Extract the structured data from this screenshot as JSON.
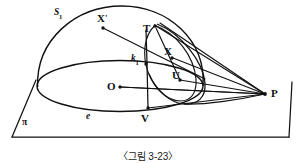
{
  "figure": {
    "caption": "〈그림 3-23〉",
    "type": "geometry-diagram",
    "stroke_color": "#111111",
    "background_color": "#ffffff"
  },
  "labels": {
    "sphere": {
      "text": "S",
      "subscript": "1",
      "x": 54,
      "y": 8
    },
    "x_prime": {
      "text": "X",
      "prime": "'",
      "x": 97,
      "y": 13
    },
    "tangent_point_t": {
      "text": "T",
      "x": 143,
      "y": 23
    },
    "point_x": {
      "text": "X",
      "x": 164,
      "y": 46
    },
    "circle_k": {
      "text": "k",
      "subscript": "1",
      "x": 131,
      "y": 54
    },
    "point_u": {
      "text": "U",
      "x": 172,
      "y": 70
    },
    "center_o": {
      "text": "O",
      "x": 107,
      "y": 81
    },
    "ellipse_e": {
      "text": "e",
      "x": 86,
      "y": 112
    },
    "point_v": {
      "text": "V",
      "x": 141,
      "y": 113
    },
    "apex_p": {
      "text": "P",
      "x": 271,
      "y": 88
    },
    "plane_pi": {
      "text": "π",
      "x": 22,
      "y": 118
    }
  },
  "points": {
    "x_prime_dot": {
      "x": 103,
      "y": 27
    },
    "x_dot": {
      "x": 172,
      "y": 58
    },
    "k1_dot": {
      "x": 144,
      "y": 66
    },
    "o_dot": {
      "x": 120,
      "y": 87
    },
    "t_dot": {
      "x": 155,
      "y": 27
    },
    "u_dot": {
      "x": 180,
      "y": 80
    },
    "v_dot": {
      "x": 148,
      "y": 108
    },
    "p_dot": {
      "x": 265,
      "y": 94
    }
  },
  "geometry": {
    "plane_label": "π",
    "plane_corners": [
      [
        18,
        78
      ],
      [
        283,
        78
      ],
      [
        296,
        140
      ],
      [
        6,
        140
      ]
    ],
    "sphere_center": [
      120,
      87
    ],
    "ellipse_base": {
      "cx": 120,
      "cy": 86,
      "rx": 84,
      "ry": 26
    },
    "cone_apex": [
      265,
      94
    ]
  }
}
